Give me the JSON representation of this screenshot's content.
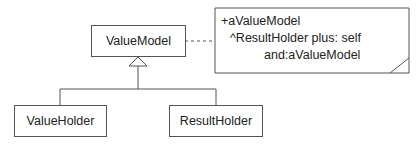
{
  "diagram": {
    "type": "UML class diagram",
    "classes": [
      {
        "id": "value-model",
        "name": "ValueModel"
      },
      {
        "id": "value-holder",
        "name": "ValueHolder"
      },
      {
        "id": "result-holder",
        "name": "ResultHolder"
      }
    ],
    "relationships": [
      {
        "type": "generalization",
        "from": "ValueHolder",
        "to": "ValueModel"
      },
      {
        "type": "generalization",
        "from": "ResultHolder",
        "to": "ValueModel"
      },
      {
        "type": "note-anchor",
        "from": "ValueModel",
        "to": "note"
      }
    ],
    "note": {
      "lines": [
        "+aValueModel",
        "^ResultHolder plus: self",
        "and:aValueModel"
      ]
    },
    "colors": {
      "line": "#555555",
      "text": "#222222",
      "background": "#ffffff"
    }
  }
}
